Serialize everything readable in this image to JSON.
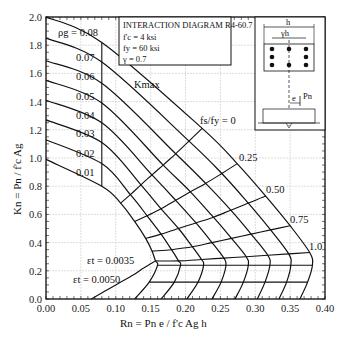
{
  "chart_data": {
    "type": "line",
    "title": "INTERACTION DIAGRAM R4-60.7",
    "parameters": [
      "f'c = 4 ksi",
      "fy = 60 ksi",
      "γ = 0.7"
    ],
    "xlabel": "Rn = Pn e / f'c Ag h",
    "ylabel": "Kn = Pn / f'c Ag",
    "xlim": [
      0.0,
      0.4
    ],
    "ylim": [
      0.0,
      2.0
    ],
    "xticks": [
      "0.00",
      "0.05",
      "0.10",
      "0.15",
      "0.20",
      "0.25",
      "0.30",
      "0.35",
      "0.40"
    ],
    "yticks": [
      "0.0",
      "0.2",
      "0.4",
      "0.6",
      "0.8",
      "1.0",
      "1.2",
      "1.4",
      "1.6",
      "1.8",
      "2.0"
    ],
    "grid": true,
    "series_rho": [
      {
        "name": "ρg = 0.08",
        "points": [
          [
            0,
            2.0
          ],
          [
            0.08,
            1.82
          ],
          [
            0.224,
            1.21
          ],
          [
            0.274,
            0.96
          ],
          [
            0.315,
            0.73
          ],
          [
            0.35,
            0.52
          ],
          [
            0.378,
            0.33
          ],
          [
            0.382,
            0.24
          ],
          [
            0.375,
            0.12
          ],
          [
            0.364,
            0.0
          ]
        ]
      },
      {
        "name": "0.07",
        "points": [
          [
            0,
            1.85
          ],
          [
            0.08,
            1.68
          ],
          [
            0.205,
            1.12
          ],
          [
            0.252,
            0.89
          ],
          [
            0.29,
            0.68
          ],
          [
            0.322,
            0.49
          ],
          [
            0.348,
            0.32
          ],
          [
            0.351,
            0.24
          ],
          [
            0.345,
            0.12
          ],
          [
            0.334,
            0.0
          ]
        ]
      },
      {
        "name": "0.06",
        "points": [
          [
            0,
            1.69
          ],
          [
            0.08,
            1.53
          ],
          [
            0.186,
            1.03
          ],
          [
            0.229,
            0.82
          ],
          [
            0.265,
            0.63
          ],
          [
            0.294,
            0.46
          ],
          [
            0.318,
            0.31
          ],
          [
            0.321,
            0.24
          ],
          [
            0.314,
            0.12
          ],
          [
            0.303,
            0.0
          ]
        ]
      },
      {
        "name": "0.05",
        "points": [
          [
            0,
            1.55
          ],
          [
            0.08,
            1.39
          ],
          [
            0.168,
            0.95
          ],
          [
            0.207,
            0.76
          ],
          [
            0.24,
            0.58
          ],
          [
            0.266,
            0.43
          ],
          [
            0.287,
            0.3
          ],
          [
            0.29,
            0.24
          ],
          [
            0.283,
            0.12
          ],
          [
            0.271,
            0.0
          ]
        ]
      },
      {
        "name": "0.04",
        "points": [
          [
            0,
            1.41
          ],
          [
            0.08,
            1.25
          ],
          [
            0.152,
            0.88
          ],
          [
            0.186,
            0.7
          ],
          [
            0.215,
            0.54
          ],
          [
            0.238,
            0.4
          ],
          [
            0.255,
            0.29
          ],
          [
            0.258,
            0.24
          ],
          [
            0.251,
            0.12
          ],
          [
            0.238,
            0.0
          ]
        ]
      },
      {
        "name": "0.03",
        "points": [
          [
            0,
            1.27
          ],
          [
            0.08,
            1.11
          ],
          [
            0.136,
            0.81
          ],
          [
            0.165,
            0.64
          ],
          [
            0.19,
            0.5
          ],
          [
            0.21,
            0.37
          ],
          [
            0.223,
            0.28
          ],
          [
            0.226,
            0.24
          ],
          [
            0.218,
            0.12
          ],
          [
            0.202,
            0.0
          ]
        ]
      },
      {
        "name": "0.02",
        "points": [
          [
            0,
            1.13
          ],
          [
            0.08,
            0.96
          ],
          [
            0.121,
            0.74
          ],
          [
            0.145,
            0.59
          ],
          [
            0.165,
            0.46
          ],
          [
            0.18,
            0.35
          ],
          [
            0.19,
            0.27
          ],
          [
            0.193,
            0.24
          ],
          [
            0.184,
            0.12
          ],
          [
            0.165,
            0.0
          ]
        ]
      },
      {
        "name": "0.01",
        "points": [
          [
            0,
            0.99
          ],
          [
            0.08,
            0.8
          ],
          [
            0.107,
            0.68
          ],
          [
            0.127,
            0.55
          ],
          [
            0.143,
            0.43
          ],
          [
            0.152,
            0.34
          ],
          [
            0.157,
            0.27
          ],
          [
            0.16,
            0.24
          ],
          [
            0.148,
            0.12
          ],
          [
            0.127,
            0.0
          ]
        ]
      }
    ],
    "fs_fy_lines": [
      {
        "name": "fs/fy = 0",
        "label": "fs/fy = 0"
      },
      {
        "name": "0.25",
        "label": "0.25"
      },
      {
        "name": "0.50",
        "label": "0.50"
      },
      {
        "name": "0.75",
        "label": "0.75"
      },
      {
        "name": "1.0",
        "label": "1.0"
      }
    ],
    "strain_lines": [
      {
        "name": "εt = 0.0035",
        "label": "εt = 0.0035"
      },
      {
        "name": "εt = 0.0050",
        "label": "εt = 0.0050"
      }
    ],
    "annotations": [
      "Kmax",
      "ρg = 0.08"
    ]
  },
  "labels": {
    "title": "INTERACTION DIAGRAM R4-60.7",
    "fc": "f'c = 4 ksi",
    "fy": "fy = 60 ksi",
    "gamma": "γ = 0.7",
    "xlabel": "Rn = Pn e / f'c Ag h",
    "ylabel": "Kn = Pn / f'c Ag",
    "kmax": "Kmax",
    "rho_first": "ρg = 0.08",
    "rho": [
      "0.07",
      "0.06",
      "0.05",
      "0.04",
      "0.03",
      "0.02",
      "0.01"
    ],
    "fs": [
      "fs/fy = 0",
      "0.25",
      "0.50",
      "0.75",
      "1.0"
    ],
    "eps1": "εt = 0.0035",
    "eps2": "εt = 0.0050",
    "section_h": "h",
    "section_gh": "γh",
    "section_e": "e",
    "section_pn": "Pn"
  }
}
